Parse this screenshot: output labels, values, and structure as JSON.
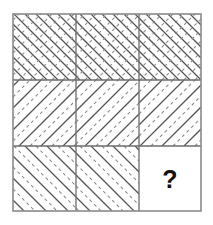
{
  "puzzle": {
    "type": "matrix-reasoning",
    "title": "3x3 diagonal hatch matrix puzzle",
    "grid": {
      "rows": 3,
      "cols": 3,
      "x": 13,
      "y": 14,
      "width": 188,
      "height": 197,
      "col_edges": [
        13,
        76,
        139,
        201
      ],
      "row_edges": [
        14,
        80,
        146,
        211
      ],
      "border_color": "#8a8a8a",
      "border_width": 1.6,
      "inner_line_color": "#6b6b6b",
      "inner_line_width": 1.3
    },
    "hatch": {
      "spacing": 11,
      "solid_color": "#555555",
      "dashed_color": "#8c8c8c",
      "solid_width": 1.25,
      "dashed_width": 1.1,
      "dash_pattern": "3.2 3.2"
    },
    "cells": [
      {
        "id": "cell-r1c1",
        "row": 1,
        "col": 1,
        "pattern": "crosshatch",
        "description": "crosshatch: solid backslash diagonals crossed with dashed slash diagonals",
        "backslash": "solid",
        "slash": "dashed",
        "label": ""
      },
      {
        "id": "cell-r1c2",
        "row": 1,
        "col": 2,
        "pattern": "crosshatch",
        "description": "crosshatch: solid backslash diagonals crossed with dashed slash diagonals",
        "backslash": "solid",
        "slash": "dashed",
        "label": ""
      },
      {
        "id": "cell-r1c3",
        "row": 1,
        "col": 3,
        "pattern": "crosshatch",
        "description": "crosshatch: solid backslash diagonals crossed with dashed slash diagonals",
        "backslash": "solid",
        "slash": "dashed",
        "label": ""
      },
      {
        "id": "cell-r2c1",
        "row": 2,
        "col": 1,
        "pattern": "slash-alternating",
        "description": "forward slash diagonals alternating solid and dashed",
        "backslash": "none",
        "slash": "alternating",
        "label": ""
      },
      {
        "id": "cell-r2c2",
        "row": 2,
        "col": 2,
        "pattern": "slash-alternating",
        "description": "forward slash diagonals alternating solid and dashed",
        "backslash": "none",
        "slash": "alternating",
        "label": ""
      },
      {
        "id": "cell-r2c3",
        "row": 2,
        "col": 3,
        "pattern": "slash-alternating",
        "description": "forward slash diagonals alternating solid and dashed",
        "backslash": "none",
        "slash": "alternating",
        "label": ""
      },
      {
        "id": "cell-r3c1",
        "row": 3,
        "col": 1,
        "pattern": "backslash-alternating",
        "description": "backslash diagonals alternating solid and dashed",
        "backslash": "alternating",
        "slash": "none",
        "label": ""
      },
      {
        "id": "cell-r3c2",
        "row": 3,
        "col": 2,
        "pattern": "backslash-alternating",
        "description": "backslash diagonals alternating solid and dashed",
        "backslash": "alternating",
        "slash": "none",
        "label": ""
      },
      {
        "id": "cell-r3c3",
        "row": 3,
        "col": 3,
        "pattern": "blank",
        "description": "blank answer cell containing a question mark",
        "backslash": "none",
        "slash": "none",
        "label": "?"
      }
    ]
  }
}
